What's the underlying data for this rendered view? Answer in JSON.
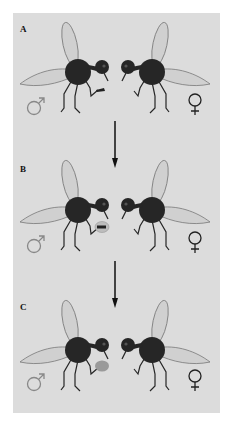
{
  "figure": {
    "background": "#dcdcdc",
    "panels": [
      {
        "label": "A",
        "y": 13,
        "male_symbol": "♂",
        "female_symbol": "♀",
        "gift": "small-dark-object",
        "gift_color": "#222222"
      },
      {
        "label": "B",
        "y": 150,
        "male_symbol": "♂",
        "female_symbol": "♀",
        "gift": "wrapped-object",
        "gift_color": "#bdbdbd"
      },
      {
        "label": "C",
        "y": 288,
        "male_symbol": "♂",
        "female_symbol": "♀",
        "gift": "grey-balloon",
        "gift_color": "#9a9a9a"
      }
    ],
    "arrows": [
      {
        "from": "A",
        "to": "B"
      },
      {
        "from": "B",
        "to": "C"
      }
    ],
    "colors": {
      "body": "#262626",
      "wing": "#d0d0d0",
      "wing_outline": "#777777",
      "symbol": "#888888",
      "female_symbol": "#222222"
    }
  }
}
